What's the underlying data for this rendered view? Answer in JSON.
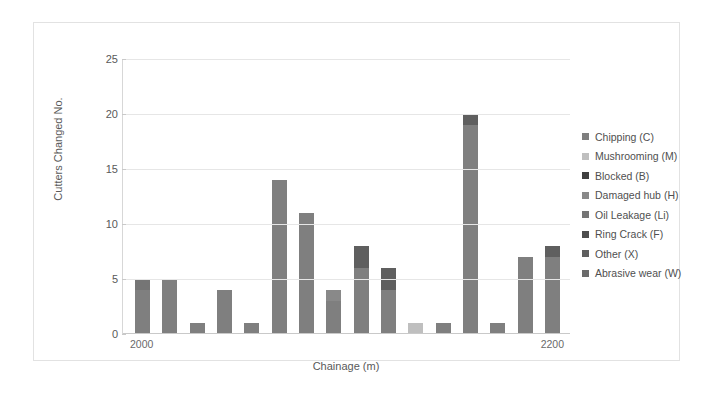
{
  "chart_data": {
    "type": "bar",
    "stacked": true,
    "title": "",
    "xlabel": "Chainage (m)",
    "ylabel": "Cutters Changed No.",
    "ylim": [
      0,
      25
    ],
    "yticks": [
      0,
      5,
      10,
      15,
      20,
      25
    ],
    "grid": true,
    "legend_position": "right",
    "x_tick_labels": [
      "2000",
      "2200"
    ],
    "x_tick_positions": [
      0,
      15
    ],
    "categories": [
      "2000",
      "2013",
      "2026",
      "2039",
      "2052",
      "2065",
      "2078",
      "2091",
      "2104",
      "2117",
      "2130",
      "2143",
      "2156",
      "2169",
      "2182",
      "2200"
    ],
    "totals": [
      5,
      5,
      1,
      4,
      1,
      14,
      11,
      4,
      8,
      6,
      1,
      1,
      20,
      1,
      7,
      8
    ],
    "series": [
      {
        "name": "Chipping (C)",
        "color": "#7f7f7f",
        "values": [
          4,
          5,
          1,
          4,
          1,
          14,
          11,
          3,
          6,
          4,
          0,
          1,
          19,
          1,
          7,
          7
        ]
      },
      {
        "name": "Mushrooming (M)",
        "color": "#bfbfbf",
        "values": [
          0,
          0,
          0,
          0,
          0,
          0,
          0,
          0,
          0,
          0,
          1,
          0,
          0,
          0,
          0,
          0
        ]
      },
      {
        "name": "Blocked (B)",
        "color": "#404040",
        "values": [
          0,
          0,
          0,
          0,
          0,
          0,
          0,
          0,
          0,
          0,
          0,
          0,
          0,
          0,
          0,
          0
        ]
      },
      {
        "name": "Damaged hub (H)",
        "color": "#898989",
        "values": [
          0,
          0,
          0,
          0,
          0,
          0,
          0,
          1,
          0,
          0,
          0,
          0,
          0,
          0,
          0,
          0
        ]
      },
      {
        "name": "Oil Leakage (Li)",
        "color": "#757575",
        "values": [
          1,
          0,
          0,
          0,
          0,
          0,
          0,
          0,
          0,
          0,
          0,
          0,
          0,
          0,
          0,
          0
        ]
      },
      {
        "name": "Ring Crack (F)",
        "color": "#4d4d4d",
        "values": [
          0,
          0,
          0,
          0,
          0,
          0,
          0,
          0,
          0,
          0,
          0,
          0,
          0,
          0,
          0,
          0
        ]
      },
      {
        "name": "Other (X)",
        "color": "#5f5f5f",
        "values": [
          0,
          0,
          0,
          0,
          0,
          0,
          0,
          0,
          2,
          2,
          0,
          0,
          1,
          0,
          0,
          1
        ]
      },
      {
        "name": "Abrasive wear (W)",
        "color": "#6b6b6b",
        "values": [
          0,
          0,
          0,
          0,
          0,
          0,
          0,
          0,
          0,
          0,
          0,
          0,
          0,
          0,
          0,
          0
        ]
      }
    ]
  },
  "axes": {
    "y_title": "Cutters Changed No.",
    "x_title": "Chainage (m)",
    "y_tick_labels": [
      "0",
      "5",
      "10",
      "15",
      "20",
      "25"
    ],
    "x_tick_labels": [
      "2000",
      "2200"
    ]
  },
  "legend": {
    "items": [
      {
        "label": "Chipping (C)",
        "color": "#7f7f7f"
      },
      {
        "label": "Mushrooming (M)",
        "color": "#bfbfbf"
      },
      {
        "label": "Blocked (B)",
        "color": "#404040"
      },
      {
        "label": "Damaged hub (H)",
        "color": "#898989"
      },
      {
        "label": "Oil Leakage (Li)",
        "color": "#757575"
      },
      {
        "label": "Ring Crack (F)",
        "color": "#4d4d4d"
      },
      {
        "label": "Other (X)",
        "color": "#5f5f5f"
      },
      {
        "label": "Abrasive wear (W)",
        "color": "#6b6b6b"
      }
    ]
  }
}
